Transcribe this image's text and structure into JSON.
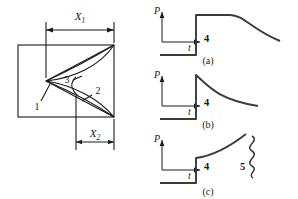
{
  "figure": {
    "left_diagram": {
      "name": "crack-geometry-diagram",
      "dimensions": [
        {
          "id": "x1",
          "label": "X",
          "subscript": "1"
        },
        {
          "id": "x2",
          "label": "X",
          "subscript": "2"
        }
      ],
      "callouts": [
        {
          "id": "c1",
          "label": "1"
        },
        {
          "id": "c2",
          "label": "2"
        },
        {
          "id": "c3",
          "label": "3"
        }
      ]
    },
    "plots": [
      {
        "id": "a",
        "caption": "(a)",
        "y_axis_label": "P",
        "x_axis_label": "t",
        "curve_label": "4",
        "shape": "step-plateau-decay",
        "extra_label": null
      },
      {
        "id": "b",
        "caption": "(b)",
        "y_axis_label": "P",
        "x_axis_label": "t",
        "curve_label": "4",
        "shape": "step-peak-decay",
        "extra_label": null
      },
      {
        "id": "c",
        "caption": "(c)",
        "y_axis_label": "P",
        "x_axis_label": "t",
        "curve_label": "4",
        "shape": "step-rising-curve",
        "extra_label": "5"
      }
    ]
  },
  "colors": {
    "ink": "#1a1a1a",
    "baseline": "#3a3a3a",
    "background": "#ffffff"
  }
}
